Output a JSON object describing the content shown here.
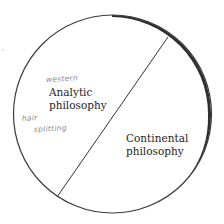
{
  "diagram": {
    "type": "divided-circle",
    "regions": [
      {
        "label_line1": "Analytic",
        "label_line2": "philosophy",
        "annotations": [
          "western",
          "hair splitting"
        ]
      },
      {
        "label_line1": "Continental",
        "label_line2": "philosophy",
        "annotations": []
      }
    ],
    "colors": {
      "background": "#ffffff",
      "circle_stroke": "#3a3a3a",
      "circle_shadow": "#2e2e2e",
      "divider": "#333333",
      "printed_text": "#1e1e1e",
      "handwriting": "#8a8a96"
    }
  }
}
